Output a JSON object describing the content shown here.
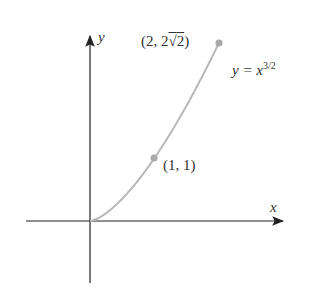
{
  "chart_data": {
    "type": "line",
    "title": "",
    "xlabel": "x",
    "ylabel": "y",
    "curve_label": "y = x^{3/2}",
    "series": [
      {
        "name": "y = x^(3/2)",
        "x": [
          0,
          0.25,
          0.5,
          0.75,
          1,
          1.25,
          1.5,
          1.75,
          2
        ],
        "values": [
          0,
          0.125,
          0.354,
          0.65,
          1,
          1.398,
          1.837,
          2.315,
          2.828
        ]
      }
    ],
    "points": [
      {
        "x": 1,
        "y": 1,
        "label": "(1, 1)"
      },
      {
        "x": 2,
        "y": 2.828,
        "label": "(2, 2√2)"
      }
    ],
    "grid": false,
    "colors": {
      "axis": "#222222",
      "curve": "#b8b8b8",
      "point": "#a8a8a8"
    }
  },
  "labels": {
    "x_axis": "x",
    "y_axis": "y",
    "curve_eq_prefix": "y = x",
    "curve_eq_exp": "3/2",
    "point1": "(1, 1)",
    "point2_prefix": "(2, 2",
    "point2_radical": "2",
    "point2_suffix": ")"
  }
}
